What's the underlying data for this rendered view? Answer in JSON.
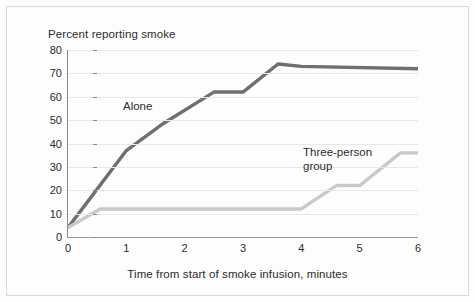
{
  "chart_data": {
    "type": "line",
    "title": "",
    "subtitle": "",
    "xlabel": "Time from start of smoke infusion, minutes",
    "ylabel": "Percent reporting smoke",
    "xlim": [
      0,
      6
    ],
    "ylim": [
      0,
      80
    ],
    "xticks": [
      "0",
      "1",
      "2",
      "3",
      "4",
      "5",
      "6"
    ],
    "yticks": [
      "0",
      "10",
      "20",
      "30",
      "40",
      "50",
      "60",
      "70",
      "80"
    ],
    "grid": "horizontal",
    "legend_position": "inline-annotation",
    "series": [
      {
        "name": "Alone",
        "color": "#6f6f6f",
        "label_text": "Alone",
        "points": [
          {
            "x": 0,
            "y": 4
          },
          {
            "x": 1,
            "y": 37
          },
          {
            "x": 1.6,
            "y": 48
          },
          {
            "x": 2.5,
            "y": 62
          },
          {
            "x": 3.0,
            "y": 62
          },
          {
            "x": 3.6,
            "y": 74
          },
          {
            "x": 4.0,
            "y": 73
          },
          {
            "x": 6,
            "y": 72
          }
        ]
      },
      {
        "name": "Three-person group",
        "color": "#c9c9c9",
        "label_text": "Three-person\ngroup",
        "points": [
          {
            "x": 0,
            "y": 4
          },
          {
            "x": 0.55,
            "y": 12
          },
          {
            "x": 4.0,
            "y": 12
          },
          {
            "x": 4.6,
            "y": 22
          },
          {
            "x": 5.0,
            "y": 22
          },
          {
            "x": 5.7,
            "y": 36
          },
          {
            "x": 6,
            "y": 36
          }
        ]
      }
    ]
  },
  "figure": {
    "y_axis_title": "Percent reporting smoke",
    "x_axis_title": "Time from start of smoke infusion, minutes",
    "label_alone": "Alone",
    "label_group": "Three-person\ngroup"
  }
}
